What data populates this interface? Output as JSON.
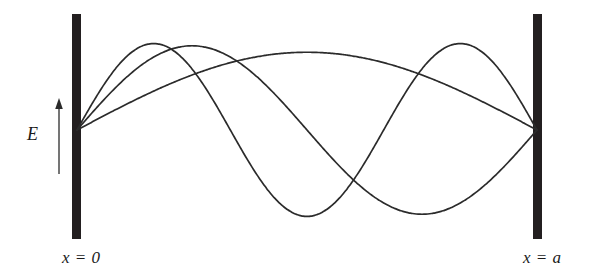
{
  "figure": {
    "background_color": "#ffffff",
    "width": 590,
    "height": 280
  },
  "walls": {
    "left": {
      "name": "left-cavity-wall",
      "color": "#231f20",
      "x_label": "x = 0"
    },
    "right": {
      "name": "right-cavity-wall",
      "color": "#231f20",
      "x_label": "x = a"
    }
  },
  "axis_labels": {
    "left": "x = 0",
    "right": "x = a",
    "field": "E"
  },
  "arrow": {
    "name": "field-direction-arrow",
    "direction": "up",
    "color": "#2b2b2b"
  },
  "chart_data": {
    "type": "line",
    "xlabel": "x",
    "ylabel": "E",
    "grid": false,
    "legend": null,
    "xlim": [
      0,
      1
    ],
    "ylim": [
      -1,
      1
    ],
    "x_tick_labels": [
      "x = 0",
      "x = a"
    ],
    "baseline_value": 0,
    "series": [
      {
        "name": "n = 1",
        "mode_number": 1,
        "formula": "E = sin(1*pi*x/a)",
        "nodes": [
          0,
          1
        ],
        "antinodes": [
          0.5
        ],
        "amplitude": 0.72,
        "color": "#2b2b2b",
        "x": [
          0,
          0.05,
          0.1,
          0.15,
          0.2,
          0.25,
          0.3,
          0.35,
          0.4,
          0.45,
          0.5,
          0.55,
          0.6,
          0.65,
          0.7,
          0.75,
          0.8,
          0.85,
          0.9,
          0.95,
          1
        ],
        "y": [
          0,
          0.113,
          0.222,
          0.325,
          0.423,
          0.509,
          0.583,
          0.643,
          0.685,
          0.711,
          0.72,
          0.711,
          0.685,
          0.643,
          0.583,
          0.509,
          0.423,
          0.325,
          0.222,
          0.113,
          0
        ]
      },
      {
        "name": "n = 2",
        "mode_number": 2,
        "formula": "E = sin(2*pi*x/a)",
        "nodes": [
          0,
          0.5,
          1
        ],
        "antinodes": [
          0.25,
          0.75
        ],
        "amplitude": 0.78,
        "color": "#2b2b2b",
        "x": [
          0,
          0.05,
          0.1,
          0.15,
          0.2,
          0.25,
          0.3,
          0.35,
          0.4,
          0.45,
          0.5,
          0.55,
          0.6,
          0.65,
          0.7,
          0.75,
          0.8,
          0.85,
          0.9,
          0.95,
          1
        ],
        "y": [
          0,
          0.241,
          0.459,
          0.631,
          0.742,
          0.78,
          0.742,
          0.631,
          0.459,
          0.241,
          0,
          -0.241,
          -0.459,
          -0.631,
          -0.742,
          -0.78,
          -0.742,
          -0.631,
          -0.459,
          -0.241,
          0
        ]
      },
      {
        "name": "n = 3",
        "mode_number": 3,
        "formula": "E = sin(3*pi*x/a)",
        "nodes": [
          0,
          0.333,
          0.667,
          1
        ],
        "antinodes": [
          0.167,
          0.5,
          0.833
        ],
        "amplitude": 0.8,
        "color": "#2b2b2b",
        "x": [
          0,
          0.05,
          0.1,
          0.15,
          0.2,
          0.25,
          0.3,
          0.35,
          0.4,
          0.45,
          0.5,
          0.55,
          0.6,
          0.65,
          0.7,
          0.75,
          0.8,
          0.85,
          0.9,
          0.95,
          1
        ],
        "y": [
          0,
          0.371,
          0.685,
          0.891,
          0.959,
          0.884,
          0.684,
          0.394,
          0.062,
          -0.276,
          -0.56,
          -0.752,
          -0.829,
          -0.782,
          -0.618,
          -0.361,
          -0.047,
          0.276,
          0.56,
          0.752,
          0
        ]
      }
    ]
  }
}
